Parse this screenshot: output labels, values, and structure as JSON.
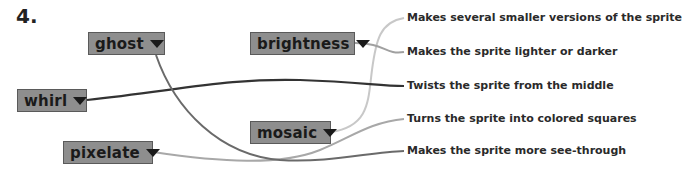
{
  "question_number": "4.",
  "blocks": [
    {
      "id": "ghost",
      "label": "ghost",
      "icon": "triangle-down-icon"
    },
    {
      "id": "brightness",
      "label": "brightness",
      "icon": "triangle-down-icon"
    },
    {
      "id": "whirl",
      "label": "whirl",
      "icon": "triangle-down-icon"
    },
    {
      "id": "mosaic",
      "label": "mosaic",
      "icon": "triangle-down-icon"
    },
    {
      "id": "pixelate",
      "label": "pixelate",
      "icon": "triangle-down-icon"
    }
  ],
  "descriptions": [
    {
      "id": "several",
      "text": "Makes several smaller versions of the sprite"
    },
    {
      "id": "lighter",
      "text": "Makes the sprite lighter or darker"
    },
    {
      "id": "twists",
      "text": "Twists the sprite from the middle"
    },
    {
      "id": "squares",
      "text": "Turns the sprite into colored squares"
    },
    {
      "id": "see-through",
      "text": "Makes the sprite more see-through"
    }
  ],
  "connections": [
    {
      "from": "ghost",
      "to": "Makes the sprite more see-through",
      "color": "#6a6a6a"
    },
    {
      "from": "brightness",
      "to": "Makes the sprite lighter or darker",
      "color": "#a0a0a0"
    },
    {
      "from": "whirl",
      "to": "Twists the sprite from the middle",
      "color": "#333333"
    },
    {
      "from": "mosaic",
      "to": "Makes several smaller versions of the sprite",
      "color": "#c8c8c8"
    },
    {
      "from": "pixelate",
      "to": "Turns the sprite into colored squares",
      "color": "#a8a8a8"
    }
  ],
  "colors": {
    "block_fill": "#8e8e8e",
    "block_border": "#5a5a5a",
    "text": "#1a1a1a"
  }
}
